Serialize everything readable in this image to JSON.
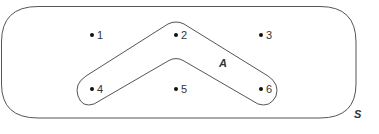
{
  "diagram": {
    "type": "venn",
    "universal_set": {
      "label": "S",
      "elements": [
        "1",
        "2",
        "3",
        "4",
        "5",
        "6"
      ]
    },
    "subset": {
      "label": "A",
      "elements": [
        "2",
        "4",
        "6"
      ]
    },
    "points": [
      {
        "label": "1",
        "x": 92,
        "y": 35
      },
      {
        "label": "2",
        "x": 176,
        "y": 35
      },
      {
        "label": "3",
        "x": 261,
        "y": 35
      },
      {
        "label": "4",
        "x": 92,
        "y": 89
      },
      {
        "label": "5",
        "x": 176,
        "y": 89
      },
      {
        "label": "6",
        "x": 261,
        "y": 89
      }
    ],
    "colors": {
      "stroke": "#555555",
      "text": "#333333",
      "dot": "#111111"
    }
  }
}
